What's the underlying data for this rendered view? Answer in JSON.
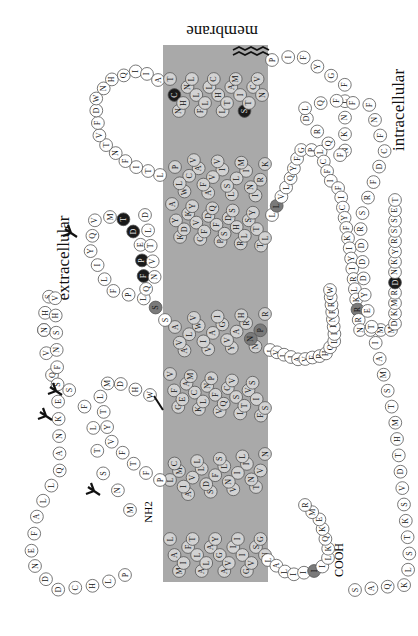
{
  "figure": {
    "orientation": "rotated 90deg; N-terminus top-left region, C-terminus bottom-right",
    "labels": {
      "membrane": "membrane",
      "extracellular": "extracellular",
      "intracellular": "intracellular",
      "n_terminus": "NH2",
      "c_terminus": "COOH"
    },
    "colors": {
      "membrane_band": "#a9a9a9",
      "residue_loop_fill": "#ffffff",
      "residue_tm_fill": "#d2d2d2",
      "residue_highlight_dark": "#1a1a1a",
      "residue_highlight_mid": "#7a7a7a",
      "residue_stroke": "#555555",
      "glycosylation_mark": "#111111"
    },
    "membrane_band": {
      "x": 163,
      "y": 45,
      "width": 105,
      "height": 537
    },
    "segments": {
      "nterm": "MNSTLFSQVENHSVHSNFSEKNAQLLAFENDDCHLPLAMIFTLALAYGAVIIIGVSGNLALIIIILKQKEMRNVTNILIVNLSFSDLLVAIMCLPFTFVYTLMDHWVFGEAMCKLNPFVQCVSITVSIFSLVLIAVERHQLIINPRGWRPNNRHAYVGIAVIWVLAVASSLPFLIYQVMTDEPFQNVTLDAYKDKYVCFDQFPSDSHRLSYTTLLLVLQYFGPLCFIFICYFKIYIRLKRRNNMMDKMRDNKYRSSETKRINIMLLSIVVAFAVCWLPLTIFNTVFDWNHQIIATCNHNLLFLLCHLTAMISTCVNPIFYGFLNKNFQRDLQFFFNFCDFRSRDDDYETIAMSTMHTDVSKTSLKQASPVAFKKINNNDDNEKI"
    },
    "highlighted_residues": [
      {
        "aa": "H",
        "shade": "mid",
        "region": "ECL3"
      },
      {
        "aa": "D",
        "shade": "dark",
        "region": "TM6"
      },
      {
        "aa": "W",
        "shade": "dark",
        "region": "TM6"
      },
      {
        "aa": "F",
        "shade": "dark",
        "region": "TM6"
      },
      {
        "aa": "N",
        "shade": "dark",
        "region": "TM6"
      },
      {
        "aa": "D",
        "shade": "mid",
        "region": "ECL2"
      },
      {
        "aa": "S",
        "shade": "mid",
        "region": "ECL2"
      },
      {
        "aa": "Y",
        "shade": "mid",
        "region": "TM5"
      },
      {
        "aa": "Q",
        "shade": "dark",
        "region": "TM5"
      },
      {
        "aa": "F",
        "shade": "dark",
        "region": "TM4"
      },
      {
        "aa": "W",
        "shade": "dark",
        "region": "TM4"
      },
      {
        "aa": "D",
        "shade": "mid",
        "region": "ECL2"
      },
      {
        "aa": "H",
        "shade": "mid",
        "region": "ECL1"
      },
      {
        "aa": "D",
        "shade": "mid",
        "region": "ECL1"
      },
      {
        "aa": "Y",
        "shade": "mid",
        "region": "TM2"
      }
    ],
    "glycosylation_sites": 4,
    "disulfide_bonds": 1,
    "palmitoylation_mark": "zigzag at C-terminal tail"
  }
}
